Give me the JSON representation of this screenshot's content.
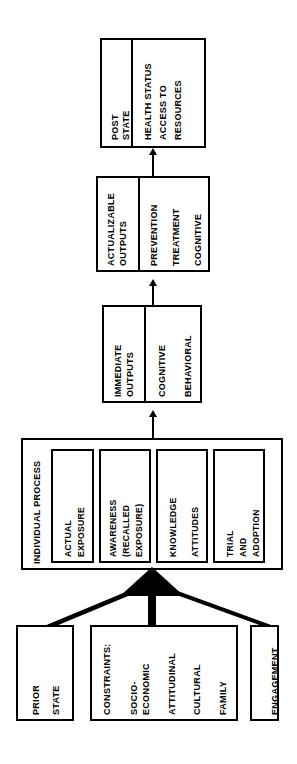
{
  "diagram": {
    "orientation": "rotated-90-ccw",
    "stroke_color": "#000000",
    "background_color": "#ffffff",
    "nodes": {
      "post_state": {
        "header": "POST\nSTATE",
        "header_lines": [
          "POST",
          "STATE"
        ],
        "items": [
          "HEALTH STATUS",
          "ACCESS TO\nRESOURCES"
        ],
        "item1": "HEALTH STATUS",
        "item2a": "ACCESS TO",
        "item2b": "RESOURCES"
      },
      "actualizable_outputs": {
        "header_lines": [
          "ACTUALIZABLE",
          "OUTPUTS"
        ],
        "header_a": "ACTUALIZABLE",
        "header_b": "OUTPUTS",
        "items": [
          "PREVENTION",
          "TREATMENT",
          "COGNITIVE"
        ],
        "item1": "PREVENTION",
        "item2": "TREATMENT",
        "item3": "COGNITIVE"
      },
      "immediate_outputs": {
        "header_lines": [
          "IMMEDIATE",
          "OUTPUTS"
        ],
        "header_a": "IMMEDIATE",
        "header_b": "OUTPUTS",
        "items": [
          "COGNITIVE",
          "BEHAVIORAL"
        ],
        "item1": "COGNITIVE",
        "item2": "BEHAVIORAL"
      },
      "individual_process": {
        "header": "INDIVIDUAL  PROCESS",
        "sub_boxes": [
          {
            "lines": [
              "ACTUAL",
              "EXPOSURE"
            ]
          },
          {
            "lines": [
              "AWARENESS",
              "(RECALLED",
              "EXPOSURE)"
            ]
          },
          {
            "lines": [
              "KNOWLEDGE",
              "ATTITUDES"
            ]
          },
          {
            "lines": [
              "TRIAL",
              "AND",
              "ADOPTION"
            ]
          }
        ],
        "sub1_a": "ACTUAL",
        "sub1_b": "EXPOSURE",
        "sub2_a": "AWARENESS",
        "sub2_b": "(RECALLED",
        "sub2_c": "EXPOSURE)",
        "sub3_a": "KNOWLEDGE",
        "sub3_b": "ATTITUDES",
        "sub4_a": "TRIAL",
        "sub4_b": "AND",
        "sub4_c": "ADOPTION"
      },
      "prior_state": {
        "header_lines": [
          "PRIOR",
          "STATE"
        ],
        "line_a": "PRIOR",
        "line_b": "STATE"
      },
      "constraints": {
        "header": "CONSTRAINTS:",
        "items": [
          "SOCIO-\nECONOMIC",
          "ATTITUDINAL",
          "CULTURAL",
          "FAMILY"
        ],
        "item1_a": "SOCIO-",
        "item1_b": "ECONOMIC",
        "item2": "ATTITUDINAL",
        "item3": "CULTURAL",
        "item4": "FAMILY"
      },
      "engagement": {
        "label": "ENGAGEMENT"
      }
    },
    "edges": [
      {
        "from": "actualizable_outputs",
        "to": "post_state",
        "style": "thin-arrow"
      },
      {
        "from": "immediate_outputs",
        "to": "actualizable_outputs",
        "style": "thin-arrow"
      },
      {
        "from": "individual_process",
        "to": "immediate_outputs",
        "style": "thin-arrow"
      },
      {
        "from": "prior_state",
        "to": "individual_process",
        "style": "thick-converging"
      },
      {
        "from": "constraints",
        "to": "individual_process",
        "style": "thick-converging"
      },
      {
        "from": "engagement",
        "to": "individual_process",
        "style": "thick-converging"
      }
    ]
  }
}
